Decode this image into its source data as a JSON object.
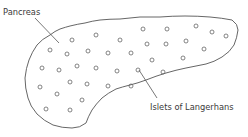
{
  "labels": {
    "pancreas": "Pancreas",
    "islets": "Islets of Langerhans"
  },
  "colors": {
    "line": "#555555",
    "text": "#3a3a3a",
    "background": "#ffffff"
  },
  "islets": [
    [
      72,
      40
    ],
    [
      96,
      35
    ],
    [
      120,
      40
    ],
    [
      143,
      29
    ],
    [
      167,
      29
    ],
    [
      196,
      26
    ],
    [
      212,
      32
    ],
    [
      226,
      36
    ],
    [
      50,
      50
    ],
    [
      67,
      54
    ],
    [
      88,
      51
    ],
    [
      108,
      53
    ],
    [
      131,
      53
    ],
    [
      147,
      44
    ],
    [
      166,
      44
    ],
    [
      186,
      41
    ],
    [
      204,
      49
    ],
    [
      42,
      68
    ],
    [
      59,
      70
    ],
    [
      77,
      66
    ],
    [
      96,
      68
    ],
    [
      117,
      71
    ],
    [
      138,
      70
    ],
    [
      152,
      60
    ],
    [
      163,
      72
    ],
    [
      183,
      58
    ],
    [
      40,
      87
    ],
    [
      57,
      94
    ],
    [
      70,
      82
    ],
    [
      87,
      84
    ],
    [
      108,
      86
    ],
    [
      131,
      86
    ],
    [
      82,
      100
    ],
    [
      46,
      109
    ],
    [
      70,
      110
    ]
  ]
}
